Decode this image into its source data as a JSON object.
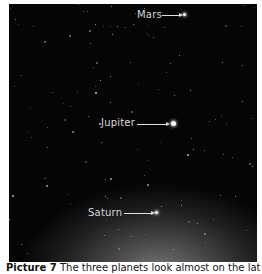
{
  "photo": {
    "description": "Night sky with three planets",
    "labels": [
      {
        "text": "Mars",
        "x": 128,
        "y": 5,
        "arrow_x": 153,
        "arrow_y": 11,
        "arrow_w": 18,
        "planet_x": 174,
        "planet_y": 9,
        "planet_size": 3
      },
      {
        "text": "Jupiter",
        "x": 92,
        "y": 113,
        "arrow_x": 128,
        "arrow_y": 120,
        "arrow_w": 30,
        "planet_x": 162,
        "planet_y": 117,
        "planet_size": 5
      },
      {
        "text": "Saturn",
        "x": 79,
        "y": 203,
        "arrow_x": 115,
        "arrow_y": 209,
        "arrow_w": 28,
        "planet_x": 146,
        "planet_y": 207,
        "planet_size": 3
      }
    ]
  },
  "caption": {
    "label": "Picture 7",
    "text": "The three planets look almost on the lat"
  }
}
